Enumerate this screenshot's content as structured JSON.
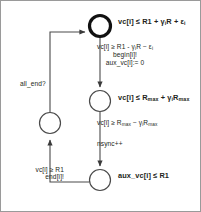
{
  "diagram": {
    "type": "timed-automaton-state-diagram",
    "stroke_color": "#231f20",
    "background_color": "#ffffff",
    "nodes": [
      {
        "id": "node-top",
        "shape": "circle-double-thick",
        "initial": true,
        "cx": 100,
        "cy": 26,
        "r": 11,
        "invariant": "vc[i] ≤ R1 + γiR + εi",
        "invariant_parts": {
          "prefix": "vc[i] ≤ R1 + ",
          "gamma": "γ",
          "gamma_sub": "i",
          "mid": "R + ",
          "epsilon": "ε",
          "epsilon_sub": "i"
        }
      },
      {
        "id": "node-mid",
        "shape": "circle",
        "initial": false,
        "cx": 100,
        "cy": 101,
        "r": 11,
        "invariant": "vc[i] ≤ Rmax + γiRmax",
        "invariant_parts": {
          "prefix": "vc[i] ≤ R",
          "sub1": "max",
          "mid": " + ",
          "gamma": "γ",
          "gamma_sub": "i",
          "tail": "R",
          "sub2": "max"
        }
      },
      {
        "id": "node-bottom",
        "shape": "circle",
        "initial": false,
        "cx": 100,
        "cy": 180,
        "r": 11,
        "invariant": "aux_vc[i] ≤ R1"
      },
      {
        "id": "node-left",
        "shape": "circle",
        "initial": false,
        "cx": 50,
        "cy": 123,
        "r": 11,
        "invariant": ""
      }
    ],
    "edges": [
      {
        "id": "edge-top-to-mid",
        "from": "node-top",
        "to": "node-mid",
        "label_lines": [
          "vc[i] ≥ R1 - γiR − εi",
          "begin[i]!",
          "aux_vc[i]:= 0"
        ],
        "guard": "vc[i] ≥ R1 - γiR − εi",
        "sync": "begin[i]!",
        "update": "aux_vc[i]:= 0"
      },
      {
        "id": "edge-mid-to-bottom",
        "from": "node-mid",
        "to": "node-bottom",
        "label_lines": [
          "vc[i] ≥ Rmax − γiRmax",
          "nsync++"
        ],
        "guard": "vc[i] ≥ Rmax − γiRmax",
        "update": "nsync++"
      },
      {
        "id": "edge-bottom-to-left",
        "from": "node-bottom",
        "to": "node-left",
        "label_lines": [
          "vc[i] ≥ R1",
          "end[i]!"
        ],
        "guard": "vc[i] ≥ R1",
        "sync": "end[i]!"
      },
      {
        "id": "edge-left-to-top",
        "from": "node-left",
        "to": "node-top",
        "label_lines": [
          "all_end?"
        ],
        "sync": "all_end?"
      }
    ],
    "labels": {
      "node_top": "vc[i] ≤ R1 + γiR + εi",
      "node_mid": "vc[i] ≤ Rmax + γiRmax",
      "node_bottom": "aux_vc[i] ≤ R1",
      "edge_top_l1": "vc[i] ≥ R1 - γiR − εi",
      "edge_top_l2": "begin[i]!",
      "edge_top_l3": "aux_vc[i]:= 0",
      "edge_mid_guard": "vc[i] ≥ Rmax − γiRmax",
      "edge_mid_update": "nsync++",
      "edge_allend": "all_end?",
      "edge_bottom_l1": "vc[i] ≥ R1",
      "edge_bottom_l2": "end[i]!"
    }
  }
}
